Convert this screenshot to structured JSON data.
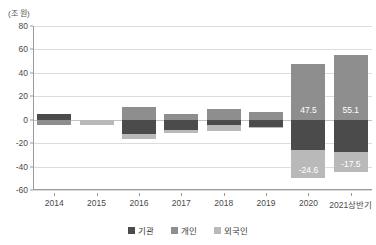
{
  "chart_data": {
    "type": "bar",
    "title": "",
    "subtitle": "",
    "unit_label": "(조 원)",
    "xlabel": "",
    "ylabel": "",
    "ylim": [
      -60,
      80
    ],
    "yticks": [
      80,
      60,
      40,
      20,
      0,
      -20,
      -40,
      -60
    ],
    "ytick_labels": [
      "80",
      "60",
      "40",
      "20",
      "0",
      "-20",
      "-40",
      "-60"
    ],
    "grid": true,
    "stacked": true,
    "legend_position": "bottom",
    "categories": [
      "2014",
      "2015",
      "2016",
      "2017",
      "2018",
      "2019",
      "2020",
      "2021상반기"
    ],
    "series": [
      {
        "name": "기관",
        "color": "#4b4b4b",
        "values": [
          4.8,
          0.0,
          -12.2,
          -9.0,
          -4.5,
          -6.5,
          -25.5,
          -27.5
        ]
      },
      {
        "name": "개인",
        "color": "#8e8e8e",
        "values": [
          -4.3,
          0.0,
          11.0,
          5.0,
          9.5,
          6.3,
          47.5,
          55.1
        ]
      },
      {
        "name": "외국인",
        "color": "#b9b9b9",
        "values": [
          0.0,
          -4.6,
          -4.0,
          -2.0,
          -5.5,
          -1.0,
          -24.6,
          -17.5
        ]
      }
    ],
    "annotations": [
      {
        "category": "2020",
        "series": "개인",
        "text": "47.5"
      },
      {
        "category": "2020",
        "series": "외국인",
        "text": "-24.6"
      },
      {
        "category": "2021상반기",
        "series": "개인",
        "text": "55.1"
      },
      {
        "category": "2021상반기",
        "series": "외국인",
        "text": "-17.5"
      }
    ]
  },
  "legend": {
    "items": [
      {
        "label": "기관",
        "color": "#4b4b4b"
      },
      {
        "label": "개인",
        "color": "#8e8e8e"
      },
      {
        "label": "외국인",
        "color": "#b9b9b9"
      }
    ]
  }
}
